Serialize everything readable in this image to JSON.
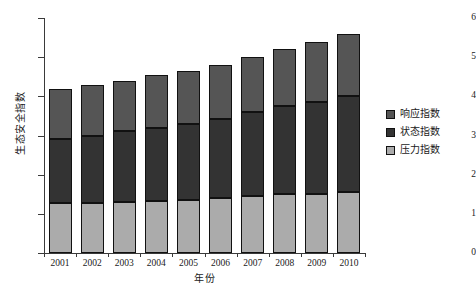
{
  "chart_data": {
    "type": "bar",
    "subtype": "stacked-bar",
    "title": "",
    "xlabel": "年份",
    "ylabel": "生态安全指数",
    "categories": [
      "2001",
      "2002",
      "2003",
      "2004",
      "2005",
      "2006",
      "2007",
      "2008",
      "2009",
      "2010"
    ],
    "series": [
      {
        "name": "压力指数",
        "color": "#ababab",
        "values": [
          1.27,
          1.28,
          1.3,
          1.32,
          1.35,
          1.4,
          1.45,
          1.5,
          1.5,
          1.55
        ]
      },
      {
        "name": "状态指数",
        "color": "#333333",
        "values": [
          1.63,
          1.72,
          1.82,
          1.88,
          1.95,
          2.02,
          2.15,
          2.25,
          2.35,
          2.45
        ]
      },
      {
        "name": "响应指数",
        "color": "#555555",
        "values": [
          1.3,
          1.3,
          1.28,
          1.35,
          1.35,
          1.38,
          1.4,
          1.45,
          1.55,
          1.6
        ]
      }
    ],
    "cumulative_tops": {
      "pressure": [
        1.27,
        1.28,
        1.3,
        1.32,
        1.35,
        1.4,
        1.45,
        1.5,
        1.5,
        1.55
      ],
      "state": [
        2.9,
        3.0,
        3.12,
        3.2,
        3.3,
        3.42,
        3.6,
        3.75,
        3.85,
        4.0
      ],
      "total": [
        4.2,
        4.3,
        4.4,
        4.55,
        4.65,
        4.8,
        5.0,
        5.2,
        5.4,
        5.6
      ]
    },
    "ylim": [
      0,
      6
    ],
    "yticks": [
      0,
      1,
      2,
      3,
      4,
      5,
      6
    ],
    "ytick_labels": [
      "0",
      "1",
      "2",
      "3",
      "4",
      "5",
      "6"
    ],
    "grid": false,
    "legend_position": "right",
    "legend_order_top_to_bottom": [
      "响应指数",
      "状态指数",
      "压力指数"
    ]
  },
  "axes": {
    "y_title": "生态安全指数",
    "x_title": "年份"
  },
  "legend": {
    "items": [
      {
        "label": "响应指数",
        "color": "#555555"
      },
      {
        "label": "状态指数",
        "color": "#333333"
      },
      {
        "label": "压力指数",
        "color": "#ababab"
      }
    ]
  },
  "colors": {
    "response": "#555555",
    "state": "#333333",
    "pressure": "#ababab",
    "outline": "#111111",
    "axis": "#3a3a3a",
    "background": "#ffffff"
  }
}
